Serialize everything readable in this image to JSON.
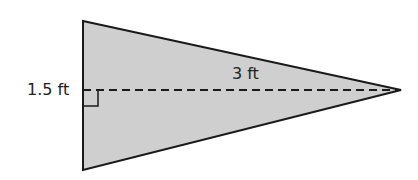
{
  "figure": {
    "shape": "isosceles-triangle",
    "fill_color": "#cfcfcf",
    "stroke_color": "#1a1a1a",
    "labels": {
      "height": "1.5 ft",
      "base": "3 ft"
    },
    "marks": [
      "right-angle-marker",
      "dashed-altitude"
    ]
  }
}
